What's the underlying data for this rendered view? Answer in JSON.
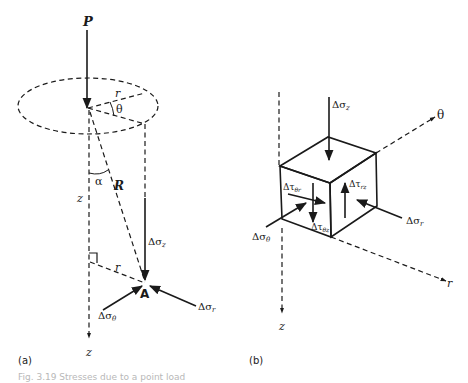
{
  "figure": {
    "panel_a": {
      "label": "(a)",
      "load_label": "P",
      "radius_label": "r",
      "angle_theta_label": "θ",
      "angle_alpha_label": "α",
      "depth_label": "z",
      "distance_label": "R",
      "radial_label": "r",
      "point_label": "A",
      "axis_z_label": "z",
      "stress_z": "Δσ",
      "stress_z_sub": "z",
      "stress_theta": "Δσ",
      "stress_theta_sub": "θ",
      "stress_r": "Δσ",
      "stress_r_sub": "r"
    },
    "panel_b": {
      "label": "(b)",
      "axis_theta_label": "θ",
      "axis_r_label": "r",
      "axis_z_label": "z",
      "stress_z": "Δσ",
      "stress_z_sub": "z",
      "stress_theta": "Δσ",
      "stress_theta_sub": "θ",
      "stress_r": "Δσ",
      "stress_r_sub": "r",
      "shear_theta_r": "Δτ",
      "shear_theta_r_sub": "θr",
      "shear_theta_z": "Δτ",
      "shear_theta_z_sub": "θz",
      "shear_r_z": "Δτ",
      "shear_r_z_sub": "rz"
    },
    "caption": "Fig. 3.19  Stresses due to a point load"
  },
  "colors": {
    "ink": "#1a1a1a",
    "background": "#ffffff"
  }
}
